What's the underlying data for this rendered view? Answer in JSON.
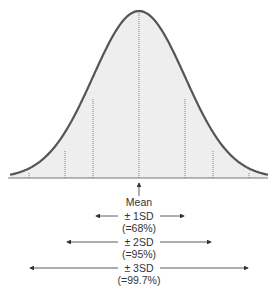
{
  "diagram": {
    "mean_label": "Mean",
    "ranges": [
      {
        "label": "± 1SD",
        "percent": "(=68%)"
      },
      {
        "label": "± 2SD",
        "percent": "(=95%)"
      },
      {
        "label": "± 3SD",
        "percent": "(=99.7%)"
      }
    ],
    "colors": {
      "curve": "#555555",
      "fill": "#eeeeee",
      "lines": "#666666",
      "text": "#333333"
    }
  }
}
